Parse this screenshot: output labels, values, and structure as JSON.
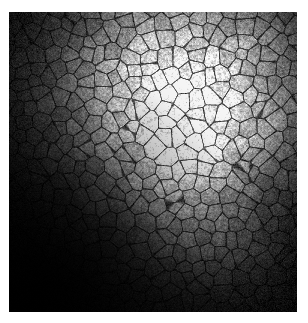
{
  "page": {
    "width": 308,
    "height": 323,
    "background_color": "#ffffff"
  },
  "image_panel": {
    "name": "micrograph",
    "modality": "confocal reflectance microscopy",
    "subject": "polygonal cell mosaic (endothelial-like monolayer)",
    "color_mode": "grayscale",
    "left": 9,
    "top": 12,
    "width": 288,
    "height": 300,
    "border_color": "#000000",
    "base_color": "#000000",
    "caption": ""
  },
  "illumination": {
    "type": "radial-vignette",
    "hotspot_cx_frac": 0.58,
    "hotspot_cy_frac": 0.3,
    "hotspot_radius_frac": 0.42,
    "falloff_radius_frac": 1.05,
    "peak_level": 232,
    "mid_level": 96,
    "floor_level": 2,
    "secondary_hotspot_cx_frac": 0.62,
    "secondary_hotspot_cy_frac": 0.52,
    "secondary_peak_level": 150,
    "dark_corner": "bottom-left"
  },
  "cell_mosaic": {
    "pattern": "voronoi-polygonal",
    "mean_cell_diameter_px": 16,
    "cell_count_estimate": 520,
    "jitter": 0.42,
    "border_darkness": 0.55,
    "border_width_px": 1.6,
    "interior_speckle_amplitude": 0.22,
    "speckle_scale_px": 1.5
  },
  "noise": {
    "type": "gaussian-grain",
    "sigma": 11,
    "fine_grain_sigma": 6
  },
  "histogram": {
    "min": 0,
    "max": 255,
    "approx_mean": 58,
    "approx_median": 36,
    "black_fraction": 0.31
  },
  "annotations": {
    "scalebar_visible": false,
    "labels": [],
    "overlay_text": ""
  }
}
